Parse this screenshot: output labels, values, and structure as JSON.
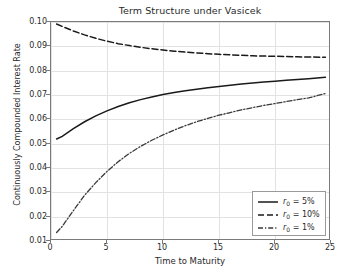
{
  "chart_data": {
    "type": "line",
    "title": "Term Structure under Vasicek",
    "xlabel": "Time to Maturity",
    "ylabel": "Continuously Compounded Interest Rate",
    "xlim": [
      0,
      25
    ],
    "ylim": [
      0.01,
      0.1
    ],
    "xticks": [
      "0",
      "5",
      "10",
      "15",
      "20",
      "25"
    ],
    "xtick_values": [
      0,
      5,
      10,
      15,
      20,
      25
    ],
    "yticks": [
      "0.01",
      "0.02",
      "0.03",
      "0.04",
      "0.05",
      "0.06",
      "0.07",
      "0.08",
      "0.09",
      "0.10"
    ],
    "ytick_values": [
      0.01,
      0.02,
      0.03,
      0.04,
      0.05,
      0.06,
      0.07,
      0.08,
      0.09,
      0.1
    ],
    "grid": true,
    "legend_position": "lower right",
    "x": [
      0.5,
      1,
      2,
      3,
      4,
      5,
      6,
      7,
      8,
      9,
      10,
      11,
      12,
      13,
      14,
      15,
      16,
      17,
      18,
      19,
      20,
      21,
      22,
      23,
      24.5
    ],
    "series": [
      {
        "name": "r_0 = 5%",
        "label": "r",
        "label_sub": "0",
        "label_rest": " = 5%",
        "linestyle": "solid",
        "color": "#1a1a1a",
        "values": [
          0.0519,
          0.053,
          0.0562,
          0.059,
          0.0614,
          0.0635,
          0.0653,
          0.0668,
          0.0681,
          0.0692,
          0.0702,
          0.071,
          0.0717,
          0.0724,
          0.073,
          0.0735,
          0.074,
          0.0745,
          0.0749,
          0.0753,
          0.0757,
          0.0761,
          0.0764,
          0.0767,
          0.0773
        ]
      },
      {
        "name": "r_0 = 10%",
        "label": "r",
        "label_sub": "0",
        "label_rest": " = 10%",
        "linestyle": "dashed",
        "color": "#1a1a1a",
        "values": [
          0.0992,
          0.0982,
          0.0963,
          0.0947,
          0.0933,
          0.0921,
          0.0911,
          0.0903,
          0.0896,
          0.089,
          0.0885,
          0.088,
          0.0876,
          0.0873,
          0.087,
          0.0867,
          0.0865,
          0.0863,
          0.0861,
          0.086,
          0.0859,
          0.0858,
          0.0857,
          0.0856,
          0.0855
        ]
      },
      {
        "name": "r_0 = 1%",
        "label": "r",
        "label_sub": "0",
        "label_rest": " = 1%",
        "linestyle": "dashdot",
        "color": "#3a3a3a",
        "values": [
          0.0135,
          0.016,
          0.0225,
          0.0288,
          0.034,
          0.0386,
          0.0426,
          0.046,
          0.0489,
          0.0514,
          0.0536,
          0.0556,
          0.0574,
          0.059,
          0.0604,
          0.0617,
          0.0628,
          0.0639,
          0.0648,
          0.0657,
          0.0665,
          0.0673,
          0.0681,
          0.0688,
          0.0706
        ]
      }
    ]
  }
}
